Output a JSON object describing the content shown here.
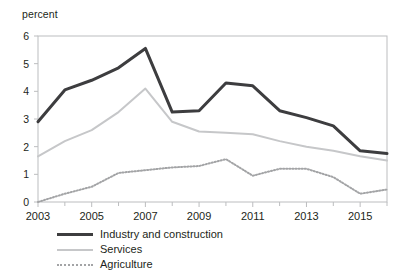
{
  "chart_data": {
    "type": "line",
    "title": "",
    "subtitle": "",
    "xlabel": "",
    "ylabel": "percent",
    "unit_label": "percent",
    "x": [
      2003,
      2004,
      2005,
      2006,
      2007,
      2008,
      2009,
      2010,
      2011,
      2012,
      2013,
      2014,
      2015,
      2016
    ],
    "xlim": [
      2003,
      2016
    ],
    "ylim": [
      0,
      6
    ],
    "yticks": [
      0,
      1,
      2,
      3,
      4,
      5,
      6
    ],
    "ytick_labels": [
      "0",
      "1",
      "2",
      "3",
      "4",
      "5",
      "6"
    ],
    "xticks_major": [
      2003,
      2005,
      2007,
      2009,
      2011,
      2013,
      2015
    ],
    "xtick_labels": [
      "2003",
      "2005",
      "2007",
      "2009",
      "2011",
      "2013",
      "2015"
    ],
    "xticks_minor": [
      2004,
      2006,
      2008,
      2010,
      2012,
      2014,
      2016
    ],
    "grid": false,
    "legend_position": "below",
    "series": [
      {
        "name": "Industry and construction",
        "color": "#3d3d3f",
        "style": "solid",
        "width": 3,
        "values": [
          2.9,
          4.05,
          4.4,
          4.85,
          5.55,
          3.25,
          3.3,
          4.3,
          4.2,
          3.3,
          3.05,
          2.75,
          1.85,
          1.75
        ]
      },
      {
        "name": "Services",
        "color": "#c6c7c9",
        "style": "solid",
        "width": 2,
        "values": [
          1.65,
          2.2,
          2.6,
          3.25,
          4.1,
          2.9,
          2.55,
          2.5,
          2.45,
          2.2,
          2.0,
          1.85,
          1.65,
          1.5
        ]
      },
      {
        "name": "Agriculture",
        "color": "#a3a4a6",
        "style": "dotted",
        "width": 2,
        "values": [
          0.0,
          0.3,
          0.55,
          1.05,
          1.15,
          1.25,
          1.3,
          1.55,
          0.95,
          1.2,
          1.2,
          0.9,
          0.3,
          0.45
        ]
      }
    ]
  },
  "legend": {
    "items": [
      {
        "label": "Industry and construction"
      },
      {
        "label": "Services"
      },
      {
        "label": "Agriculture"
      }
    ]
  }
}
